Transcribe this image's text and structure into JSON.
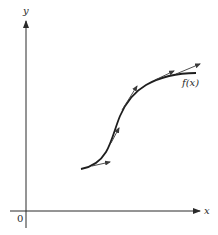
{
  "figure": {
    "axes": {
      "x_label": "x",
      "y_label": "y",
      "origin_label": "0"
    },
    "curve": {
      "label": "f(x)",
      "description": "S-shaped increasing curve with tangent vectors along it"
    },
    "tangent_vectors": [
      {
        "at": "lower start",
        "direction": "shallow"
      },
      {
        "at": "lower middle",
        "direction": "steep"
      },
      {
        "at": "upper middle",
        "direction": "steep"
      },
      {
        "at": "upper right",
        "direction": "shallow"
      },
      {
        "at": "end",
        "direction": "shallow"
      }
    ],
    "colors": {
      "ink": "#2a2a2a",
      "background": "#ffffff"
    }
  }
}
